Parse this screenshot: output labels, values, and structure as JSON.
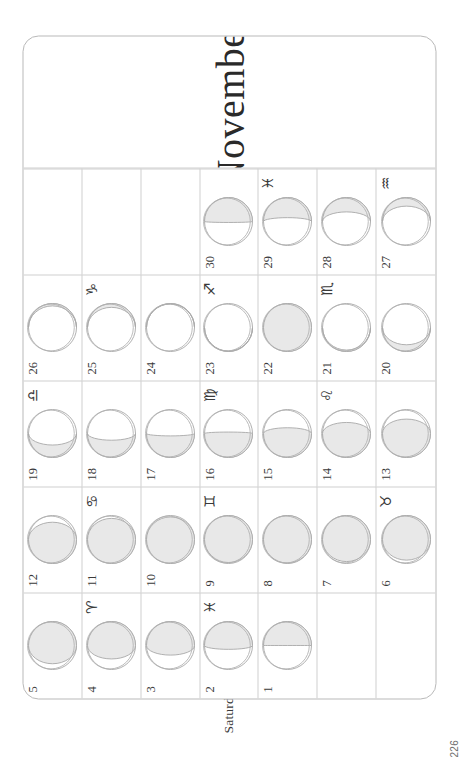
{
  "page": {
    "page_number": "226",
    "month_title": "November"
  },
  "weekday_labels": [
    "Saturday",
    "Friday",
    "Thursday",
    "Wednesday",
    "Tuesday",
    "Monday",
    "Sunday"
  ],
  "colors": {
    "ink": "#2b2b2b",
    "rule": "#cfcfcf",
    "frame": "#b9b9b9",
    "moon_outline": "#b0b0b0",
    "moon_shadow_fill": "#e8e8e8",
    "moon_shadow_stroke": "#a8a8a8",
    "paper": "#ffffff"
  },
  "calendar": {
    "weeks": 5,
    "rows": [
      {
        "weekday": "Saturday",
        "days": [
          {
            "day": "5",
            "zodiac": "",
            "zodiac_name": "",
            "illumination": 0.12,
            "waxing": false
          },
          {
            "day": "12",
            "zodiac": "",
            "zodiac_name": "",
            "illumination": 0.14,
            "waxing": true
          },
          {
            "day": "19",
            "zodiac": "♎",
            "zodiac_name": "libra",
            "illumination": 0.74,
            "waxing": true
          },
          {
            "day": "26",
            "zodiac": "",
            "zodiac_name": "",
            "illumination": 0.95,
            "waxing": false
          },
          {
            "day": "",
            "zodiac": "",
            "zodiac_name": "",
            "illumination": null,
            "waxing": null
          }
        ]
      },
      {
        "weekday": "Friday",
        "days": [
          {
            "day": "4",
            "zodiac": "♈",
            "zodiac_name": "aries",
            "illumination": 0.22,
            "waxing": false
          },
          {
            "day": "11",
            "zodiac": "♋",
            "zodiac_name": "cancer",
            "illumination": 0.06,
            "waxing": true
          },
          {
            "day": "18",
            "zodiac": "",
            "zodiac_name": "",
            "illumination": 0.64,
            "waxing": true
          },
          {
            "day": "25",
            "zodiac": "♑",
            "zodiac_name": "capricorn",
            "illumination": 0.92,
            "waxing": false
          },
          {
            "day": "",
            "zodiac": "",
            "zodiac_name": "",
            "illumination": null,
            "waxing": null
          }
        ]
      },
      {
        "weekday": "Thursday",
        "days": [
          {
            "day": "3",
            "zodiac": "",
            "zodiac_name": "",
            "illumination": 0.3,
            "waxing": false
          },
          {
            "day": "10",
            "zodiac": "",
            "zodiac_name": "",
            "illumination": 0.03,
            "waxing": true
          },
          {
            "day": "17",
            "zodiac": "",
            "zodiac_name": "",
            "illumination": 0.55,
            "waxing": true
          },
          {
            "day": "24",
            "zodiac": "",
            "zodiac_name": "",
            "illumination": 0.99,
            "waxing": false
          },
          {
            "day": "",
            "zodiac": "",
            "zodiac_name": "",
            "illumination": null,
            "waxing": null
          }
        ]
      },
      {
        "weekday": "Wednesday",
        "days": [
          {
            "day": "2",
            "zodiac": "♓",
            "zodiac_name": "pisces",
            "illumination": 0.42,
            "waxing": false
          },
          {
            "day": "9",
            "zodiac": "♊",
            "zodiac_name": "gemini",
            "illumination": 0.02,
            "waxing": false
          },
          {
            "day": "16",
            "zodiac": "♍",
            "zodiac_name": "virgo",
            "illumination": 0.47,
            "waxing": true
          },
          {
            "day": "23",
            "zodiac": "♐",
            "zodiac_name": "sagittarius",
            "illumination": 0.99,
            "waxing": true
          },
          {
            "day": "30",
            "zodiac": "",
            "zodiac_name": "",
            "illumination": 0.48,
            "waxing": false
          }
        ]
      },
      {
        "weekday": "Tuesday",
        "days": [
          {
            "day": "1",
            "zodiac": "",
            "zodiac_name": "",
            "illumination": 0.5,
            "waxing": false
          },
          {
            "day": "8",
            "zodiac": "",
            "zodiac_name": "",
            "illumination": 0.01,
            "waxing": false
          },
          {
            "day": "15",
            "zodiac": "",
            "zodiac_name": "",
            "illumination": 0.38,
            "waxing": true
          },
          {
            "day": "22",
            "zodiac": "",
            "zodiac_name": "",
            "illumination": 1.0,
            "waxing": true
          },
          {
            "day": "29",
            "zodiac": "♓",
            "zodiac_name": "pisces",
            "illumination": 0.58,
            "waxing": false
          }
        ]
      },
      {
        "weekday": "Monday",
        "days": [
          {
            "day": "",
            "zodiac": "",
            "zodiac_name": "",
            "illumination": null,
            "waxing": null
          },
          {
            "day": "7",
            "zodiac": "",
            "zodiac_name": "",
            "illumination": 0.04,
            "waxing": false
          },
          {
            "day": "14",
            "zodiac": "♌",
            "zodiac_name": "leo",
            "illumination": 0.27,
            "waxing": true
          },
          {
            "day": "21",
            "zodiac": "♏",
            "zodiac_name": "scorpio",
            "illumination": 0.97,
            "waxing": true
          },
          {
            "day": "28",
            "zodiac": "",
            "zodiac_name": "",
            "illumination": 0.7,
            "waxing": false
          }
        ]
      },
      {
        "weekday": "Sunday",
        "days": [
          {
            "day": "",
            "zodiac": "",
            "zodiac_name": "",
            "illumination": null,
            "waxing": null
          },
          {
            "day": "6",
            "zodiac": "♉",
            "zodiac_name": "taurus",
            "illumination": 0.07,
            "waxing": false
          },
          {
            "day": "13",
            "zodiac": "",
            "zodiac_name": "",
            "illumination": 0.2,
            "waxing": true
          },
          {
            "day": "20",
            "zodiac": "",
            "zodiac_name": "",
            "illumination": 0.86,
            "waxing": true
          },
          {
            "day": "27",
            "zodiac": "♒",
            "zodiac_name": "aquarius",
            "illumination": 0.82,
            "waxing": false
          }
        ]
      }
    ]
  }
}
